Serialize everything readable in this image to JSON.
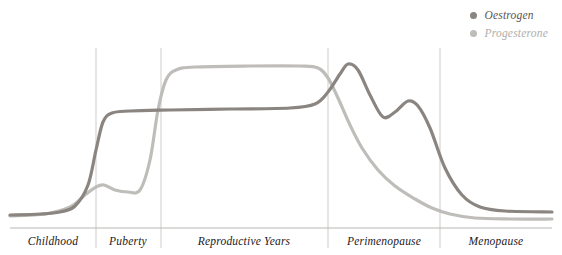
{
  "chart_data": {
    "type": "line",
    "title": "",
    "subtitle": "",
    "xlabel": "",
    "ylabel": "",
    "grid": false,
    "legend_position": "top-right",
    "xlim": [
      0,
      562
    ],
    "ylim": [
      0,
      255
    ],
    "x_axis_note": "Life stage, not numeric; hormone level on y-axis is unlabelled/relative",
    "stages": [
      {
        "name": "Childhood",
        "label": "Childhood",
        "x_start": 10,
        "x_end": 96,
        "x_center": 53
      },
      {
        "name": "Puberty",
        "label": "Puberty",
        "x_start": 96,
        "x_end": 161,
        "x_center": 128
      },
      {
        "name": "Reproductive Years",
        "label": "Reproductive Years",
        "x_start": 161,
        "x_end": 328,
        "x_center": 244
      },
      {
        "name": "Perimenopause",
        "label": "Perimenopause",
        "x_start": 328,
        "x_end": 440,
        "x_center": 384
      },
      {
        "name": "Menopause",
        "label": "Menopause",
        "x_start": 440,
        "x_end": 552,
        "x_center": 496
      }
    ],
    "dividers_x": [
      96,
      161,
      328,
      440
    ],
    "baseline_y": 228,
    "series": [
      {
        "name": "Oestrogen",
        "color": "#8a8580",
        "points": [
          [
            10,
            215
          ],
          [
            40,
            214
          ],
          [
            60,
            212
          ],
          [
            75,
            206
          ],
          [
            88,
            185
          ],
          [
            96,
            150
          ],
          [
            103,
            122
          ],
          [
            112,
            113
          ],
          [
            130,
            111
          ],
          [
            170,
            110
          ],
          [
            230,
            109
          ],
          [
            290,
            108
          ],
          [
            315,
            104
          ],
          [
            328,
            92
          ],
          [
            340,
            74
          ],
          [
            348,
            64
          ],
          [
            358,
            70
          ],
          [
            370,
            95
          ],
          [
            383,
            117
          ],
          [
            395,
            112
          ],
          [
            408,
            101
          ],
          [
            418,
            106
          ],
          [
            430,
            128
          ],
          [
            445,
            168
          ],
          [
            462,
            195
          ],
          [
            480,
            207
          ],
          [
            505,
            211
          ],
          [
            552,
            212
          ]
        ],
        "description": "Low through childhood, rises sharply at puberty, stable plateau through reproductive years, erratic high peak then second smaller peak in perimenopause, falls to low stable level in menopause"
      },
      {
        "name": "Progesterone",
        "color": "#bfbdb9",
        "points": [
          [
            10,
            216
          ],
          [
            45,
            214
          ],
          [
            70,
            207
          ],
          [
            85,
            195
          ],
          [
            96,
            187
          ],
          [
            104,
            185
          ],
          [
            115,
            190
          ],
          [
            128,
            192
          ],
          [
            140,
            190
          ],
          [
            150,
            160
          ],
          [
            158,
            110
          ],
          [
            166,
            80
          ],
          [
            176,
            70
          ],
          [
            195,
            67
          ],
          [
            250,
            66
          ],
          [
            300,
            66
          ],
          [
            318,
            68
          ],
          [
            328,
            78
          ],
          [
            338,
            98
          ],
          [
            350,
            125
          ],
          [
            362,
            148
          ],
          [
            378,
            170
          ],
          [
            395,
            186
          ],
          [
            415,
            199
          ],
          [
            432,
            208
          ],
          [
            450,
            214
          ],
          [
            475,
            218
          ],
          [
            510,
            219
          ],
          [
            552,
            219
          ]
        ],
        "description": "Low through childhood with a small bump at puberty onset, rises steeply to a high plateau through reproductive years, declines steadily through perimenopause to a very low level in menopause"
      }
    ]
  },
  "legend": {
    "items": [
      {
        "label": "Oestrogen",
        "color": "#8a8580"
      },
      {
        "label": "Progesterone",
        "color": "#bfbdb9"
      }
    ]
  },
  "axis": {
    "baseline_color": "#b9b7b3",
    "divider_color": "#cfcdc9"
  }
}
